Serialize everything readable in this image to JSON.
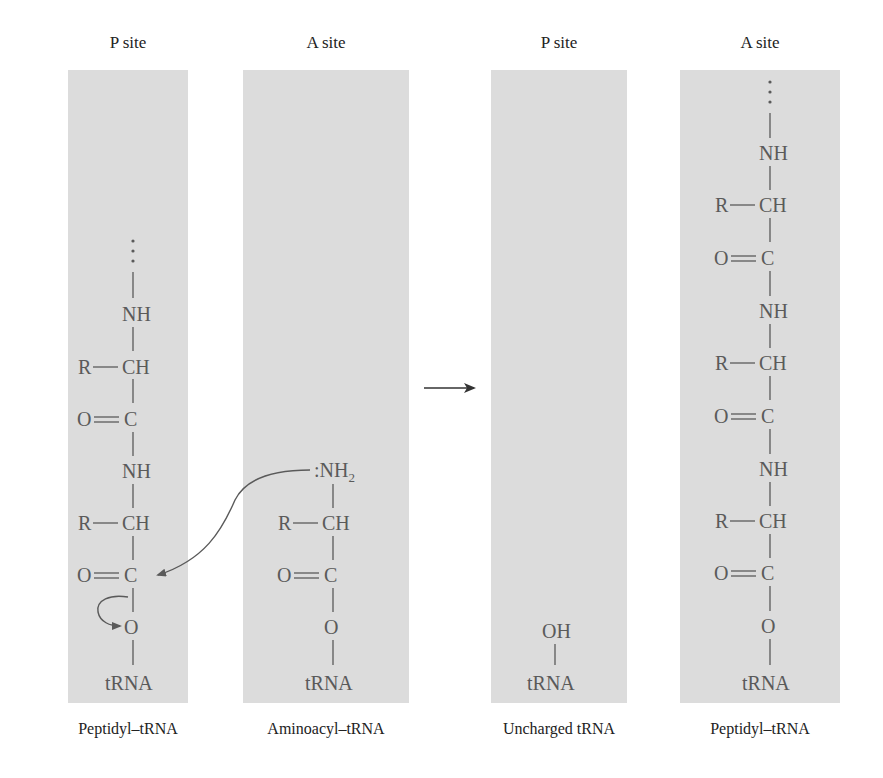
{
  "colors": {
    "panel_bg": "#dcdcdc",
    "chem_text": "#5a5a5a",
    "label_text": "#222222"
  },
  "before": {
    "p_site": {
      "title": "P site",
      "caption": "Peptidyl–tRNA",
      "chain": [
        ":",
        "NH",
        "R—CH",
        "O═C",
        "NH",
        "R—CH",
        "O═C",
        "O",
        "tRNA"
      ]
    },
    "a_site": {
      "title": "A site",
      "caption": "Aminoacyl–tRNA",
      "chain": [
        ":NH2",
        "R—CH",
        "O═C",
        "O",
        "tRNA"
      ]
    }
  },
  "reaction_arrow": "→",
  "after": {
    "p_site": {
      "title": "P site",
      "caption": "Uncharged tRNA",
      "chain": [
        "OH",
        "tRNA"
      ]
    },
    "a_site": {
      "title": "A site",
      "caption": "Peptidyl–tRNA",
      "chain": [
        ":",
        "NH",
        "R—CH",
        "O═C",
        "NH",
        "R—CH",
        "O═C",
        "NH",
        "R—CH",
        "O═C",
        "O",
        "tRNA"
      ]
    }
  },
  "atoms": {
    "nh": "NH",
    "ch": "CH",
    "c": "C",
    "o": "O",
    "r": "R",
    "oh": "OH",
    "trna": "tRNA",
    "nh2_lone_pair": ":NH",
    "subscript_2": "2"
  }
}
